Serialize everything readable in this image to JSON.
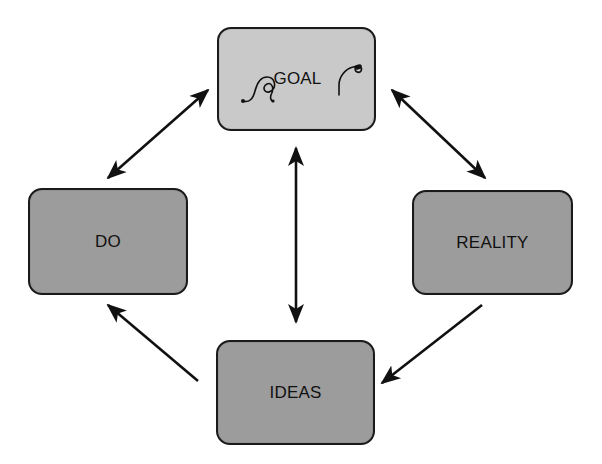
{
  "diagram": {
    "type": "cycle",
    "colors": {
      "goal_fill": "#c9c9c9",
      "node_fill": "#9c9c9c",
      "border": "#1a1a1a",
      "arrow": "#111111",
      "background": "#ffffff"
    },
    "nodes": {
      "goal": {
        "label": "GOAL",
        "decoration": "flourish-swirl"
      },
      "do": {
        "label": "DO"
      },
      "reality": {
        "label": "REALITY"
      },
      "ideas": {
        "label": "IDEAS"
      }
    },
    "edges": [
      {
        "from": "goal",
        "to": "do",
        "direction": "bidirectional"
      },
      {
        "from": "goal",
        "to": "reality",
        "direction": "bidirectional"
      },
      {
        "from": "goal",
        "to": "ideas",
        "direction": "bidirectional"
      },
      {
        "from": "reality",
        "to": "ideas",
        "direction": "forward"
      },
      {
        "from": "ideas",
        "to": "do",
        "direction": "forward"
      }
    ]
  }
}
